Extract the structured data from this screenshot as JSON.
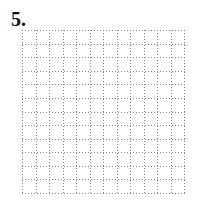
{
  "problem": {
    "number_label": "5."
  },
  "grid": {
    "columns": 12,
    "rows": 12,
    "line_style": "dotted",
    "line_color": "#8a8a8a"
  }
}
